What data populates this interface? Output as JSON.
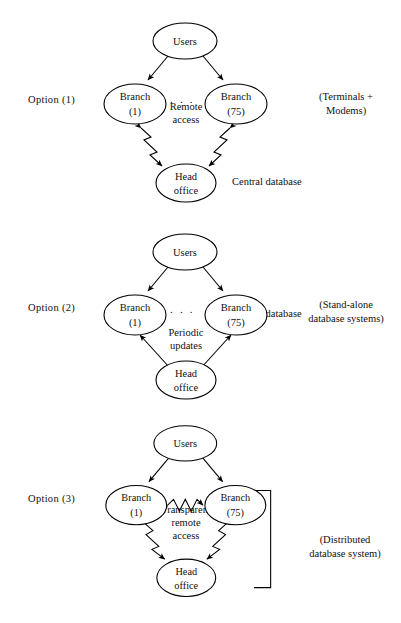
{
  "figure": {
    "type": "diagram",
    "background_color": "#ffffff",
    "line_color": "#000000",
    "text_color": "#111111"
  },
  "nodes": {
    "users": "Users",
    "branch_first_line1": "Branch",
    "branch_first_line2": "(1)",
    "branch_last_line1": "Branch",
    "branch_last_line2": "(75)",
    "head_office_line1": "Head",
    "head_office_line2": "office",
    "ellipsis": ". . ."
  },
  "options": [
    {
      "id": "option-1",
      "label": "Option  (1)",
      "side_note": "(Terminals +\nModems)",
      "link_note": "Remote\naccess",
      "bottom_note": "Central database",
      "link_style": "zigzag",
      "link_direction": "branches-to-head-office",
      "has_bracket": false
    },
    {
      "id": "option-2",
      "label": "Option  (2)",
      "side_note": "(Stand-alone\ndatabase systems)",
      "link_note": "Periodic\nupdates",
      "bottom_note": "Central database",
      "link_style": "straight",
      "link_direction": "head-office-to-branches",
      "has_bracket": false
    },
    {
      "id": "option-3",
      "label": "Option  (3)",
      "side_note": "(Distributed\ndatabase system)",
      "link_note": "Transparent\nremote\naccess",
      "bottom_note": "",
      "link_style": "zigzag",
      "link_direction": "branch-to-branch-and-head-office",
      "has_bracket": true
    }
  ]
}
